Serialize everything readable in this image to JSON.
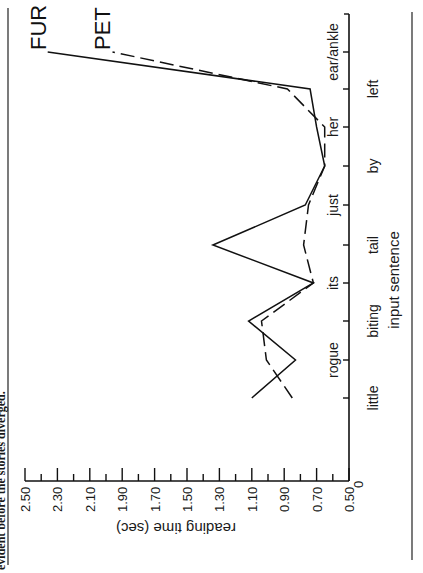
{
  "caption_fragment": "evident before the stories diverged.",
  "chart_data": {
    "type": "line",
    "orientation": "rotated 90° clockwise (value axis along bottom, word axis vertical)",
    "title": "",
    "xlabel": "input sentence",
    "ylabel": "reading time (sec)",
    "categories": [
      "little",
      "rogue",
      "biting",
      "its",
      "tail",
      "just",
      "by",
      "her",
      "left",
      "ear/ankle"
    ],
    "x_origin_label": "0",
    "ylim": [
      0.5,
      2.5
    ],
    "yticks": [
      "0.50",
      "0.70",
      "0.90",
      "1.10",
      "1.30",
      "1.50",
      "1.70",
      "1.90",
      "2.10",
      "2.30",
      "2.50"
    ],
    "minor_tick_step": 0.1,
    "grid": false,
    "legend": "inline labels at line ends",
    "series": [
      {
        "name": "FUR",
        "style": "solid",
        "values": [
          1.1,
          0.83,
          1.12,
          0.72,
          1.34,
          0.77,
          0.65,
          0.7,
          0.74,
          2.36
        ]
      },
      {
        "name": "PET",
        "style": "dashed",
        "values": [
          0.85,
          1.01,
          1.04,
          0.72,
          0.78,
          0.75,
          0.65,
          0.65,
          0.88,
          1.96
        ]
      }
    ]
  }
}
